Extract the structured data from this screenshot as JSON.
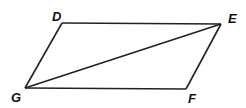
{
  "figure": {
    "type": "parallelogram with diagonal",
    "vertices": [
      {
        "name": "D",
        "label": "D",
        "x": 62,
        "y": 23,
        "lx": 52,
        "ly": 21
      },
      {
        "name": "E",
        "label": "E",
        "x": 221,
        "y": 24,
        "lx": 228,
        "ly": 23
      },
      {
        "name": "F",
        "label": "F",
        "x": 186,
        "y": 89,
        "lx": 188,
        "ly": 103
      },
      {
        "name": "G",
        "label": "G",
        "x": 25,
        "y": 88,
        "lx": 11,
        "ly": 102
      }
    ],
    "edges": [
      [
        "D",
        "E"
      ],
      [
        "E",
        "F"
      ],
      [
        "F",
        "G"
      ],
      [
        "G",
        "D"
      ]
    ],
    "diagonal": [
      "G",
      "E"
    ],
    "stroke_color": "#222222"
  }
}
